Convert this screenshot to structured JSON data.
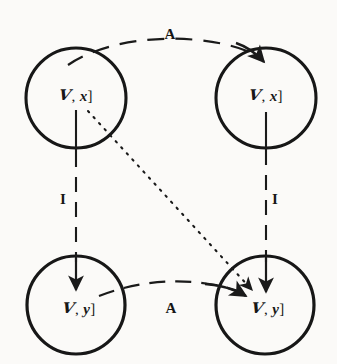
{
  "figure": {
    "kind": "commutative-diagram",
    "background_color": "#fbfaf8",
    "ink_color": "#1a1a1a",
    "width": 337,
    "height": 364
  },
  "nodes": [
    {
      "id": "top-left",
      "name": "node-top-left",
      "label_full": "ℱ, x]",
      "script_letter": "ᵋ1",
      "script_glyph": "V",
      "separator": ",",
      "variable": "x",
      "closing_bracket": "]",
      "center_x": 76,
      "center_y": 98,
      "radius": 50,
      "label_x": 76,
      "label_y": 96
    },
    {
      "id": "top-right",
      "name": "node-top-right",
      "label_full": "ℱ, x]",
      "script_letter": "ᵋ1",
      "script_glyph": "V",
      "separator": ",",
      "variable": "x",
      "closing_bracket": "]",
      "center_x": 266,
      "center_y": 98,
      "radius": 50,
      "label_x": 266,
      "label_y": 96
    },
    {
      "id": "bottom-left",
      "name": "node-bottom-left",
      "label_full": "ℱ, y]",
      "script_letter": "ᵋ1",
      "script_glyph": "V",
      "separator": ",",
      "variable": "y",
      "closing_bracket": "]",
      "center_x": 76,
      "center_y": 305,
      "radius": 49,
      "label_x": 79,
      "label_y": 309
    },
    {
      "id": "bottom-right",
      "name": "node-bottom-right",
      "label_full": "ℱ, y]",
      "script_letter": "ᵋ1",
      "script_glyph": "V",
      "separator": ",",
      "variable": "y",
      "closing_bracket": "]",
      "center_x": 265,
      "center_y": 305,
      "radius": 49,
      "label_x": 268,
      "label_y": 309
    }
  ],
  "edges": [
    {
      "id": "edge-top-A",
      "name": "edge-top-a",
      "label": "A",
      "style": "dashed",
      "from": "top-left",
      "to": "top-right",
      "shape": "arc-up",
      "label_x": 170,
      "label_y": 34
    },
    {
      "id": "edge-bottom-A",
      "name": "edge-bottom-a",
      "label": "A",
      "style": "dashed",
      "from": "bottom-left",
      "to": "bottom-right",
      "shape": "arc-down",
      "label_x": 171,
      "label_y": 308
    },
    {
      "id": "edge-left-I",
      "name": "edge-left-i",
      "label": "I",
      "style": "dashed",
      "from": "top-left",
      "to": "bottom-left",
      "shape": "vertical",
      "label_x": 63,
      "label_y": 199
    },
    {
      "id": "edge-right-I",
      "name": "edge-right-i",
      "label": "I",
      "style": "dashed",
      "from": "top-right",
      "to": "bottom-right",
      "shape": "vertical",
      "label_x": 275,
      "label_y": 199
    },
    {
      "id": "edge-diagonal",
      "name": "edge-diagonal-dotted",
      "label": "",
      "style": "dotted",
      "from": "top-left",
      "to": "bottom-right",
      "shape": "diagonal",
      "label_x": 0,
      "label_y": 0
    }
  ],
  "labels": {
    "top_arrow_label": "A",
    "bottom_arrow_label": "A",
    "left_arrow_label": "I",
    "right_arrow_label": "I"
  }
}
